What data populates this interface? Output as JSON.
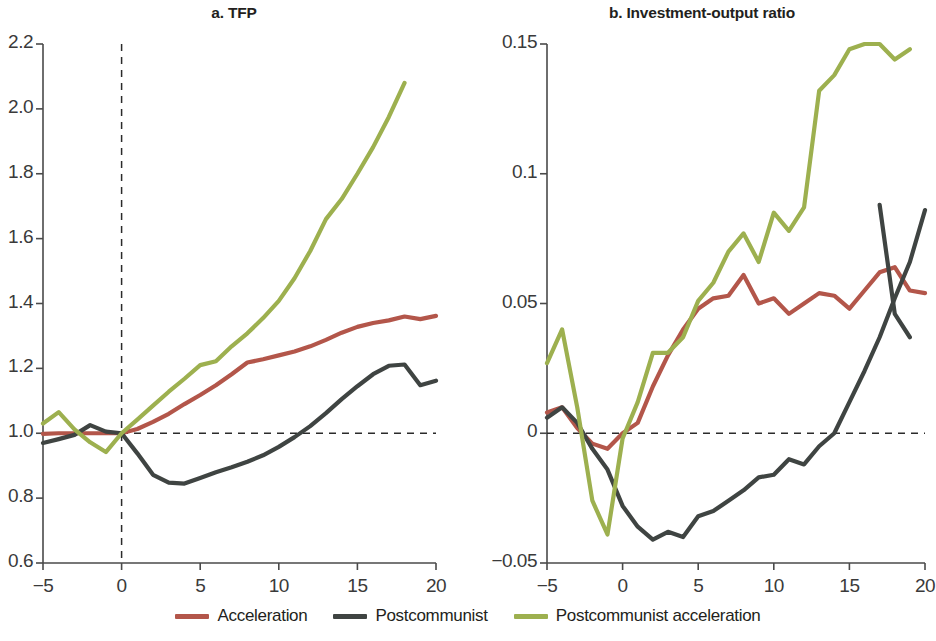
{
  "figure": {
    "width": 936,
    "height": 641,
    "background": "#ffffff"
  },
  "colors": {
    "acceleration": "#b3564a",
    "postcommunist": "#3f4442",
    "postcommunist_acceleration": "#9db04f",
    "axis": "#4a4a4a",
    "text": "#231f20"
  },
  "legend": {
    "position": "bottom-center",
    "items": [
      {
        "label": "Acceleration",
        "color": "#b3564a"
      },
      {
        "label": "Postcommunist",
        "color": "#3f4442"
      },
      {
        "label": "Postcommunist acceleration",
        "color": "#9db04f"
      }
    ]
  },
  "panel_a": {
    "title": "a. TFP",
    "ytick_labels": [
      "2.2",
      "2.0",
      "1.8",
      "1.6",
      "1.4",
      "1.2",
      "1.0",
      "0.8",
      "0.6"
    ],
    "xtick_labels": [
      "−5",
      "0",
      "5",
      "10",
      "15",
      "20"
    ]
  },
  "panel_b": {
    "title": "b. Investment-output ratio",
    "ytick_labels": [
      "0.15",
      "0.1",
      "0.05",
      "0",
      "−0.05"
    ],
    "xtick_labels": [
      "−5",
      "0",
      "5",
      "10",
      "15",
      "20"
    ]
  },
  "chart_data": [
    {
      "type": "line",
      "panel": "a",
      "title": "a. TFP",
      "xlabel": "",
      "ylabel": "",
      "xlim": [
        -5,
        20
      ],
      "ylim": [
        0.6,
        2.2
      ],
      "xticks": [
        -5,
        0,
        5,
        10,
        15,
        20
      ],
      "yticks": [
        0.6,
        0.8,
        1.0,
        1.2,
        1.4,
        1.6,
        1.8,
        2.0,
        2.2
      ],
      "grid": false,
      "reference_lines": [
        {
          "orientation": "vertical",
          "value": 0,
          "style": "dashed"
        },
        {
          "orientation": "horizontal",
          "value": 1.0,
          "style": "dashed"
        }
      ],
      "x": [
        -5,
        -4,
        -3,
        -2,
        -1,
        0,
        1,
        2,
        3,
        4,
        5,
        6,
        7,
        8,
        9,
        10,
        11,
        12,
        13,
        14,
        15,
        16,
        17,
        18,
        19,
        20
      ],
      "series": [
        {
          "name": "Acceleration",
          "color": "#b3564a",
          "values": [
            0.998,
            1.0,
            1.0,
            1.0,
            1.0,
            1.0,
            1.013,
            1.035,
            1.06,
            1.09,
            1.118,
            1.148,
            1.182,
            1.218,
            1.228,
            1.24,
            1.252,
            1.268,
            1.288,
            1.31,
            1.328,
            1.34,
            1.348,
            1.36,
            1.352,
            1.362
          ]
        },
        {
          "name": "Postcommunist",
          "color": "#3f4442",
          "values": [
            0.97,
            0.982,
            0.995,
            1.025,
            1.005,
            1.0,
            0.938,
            0.872,
            0.848,
            0.845,
            0.862,
            0.88,
            0.895,
            0.912,
            0.932,
            0.958,
            0.988,
            1.022,
            1.062,
            1.105,
            1.145,
            1.182,
            1.208,
            1.212,
            1.148,
            1.162
          ]
        },
        {
          "name": "Postcommunist acceleration",
          "color": "#9db04f",
          "values": [
            1.03,
            1.065,
            1.012,
            0.972,
            0.942,
            1.0,
            1.042,
            1.085,
            1.128,
            1.168,
            1.21,
            1.222,
            1.268,
            1.308,
            1.355,
            1.408,
            1.478,
            1.562,
            1.66,
            1.722,
            1.8,
            1.882,
            1.975,
            2.08,
            null,
            null
          ]
        }
      ]
    },
    {
      "type": "line",
      "panel": "b",
      "title": "b. Investment-output ratio",
      "xlabel": "",
      "ylabel": "",
      "xlim": [
        -5,
        20
      ],
      "ylim": [
        -0.05,
        0.15
      ],
      "xticks": [
        -5,
        0,
        5,
        10,
        15,
        20
      ],
      "yticks": [
        -0.05,
        0,
        0.05,
        0.1,
        0.15
      ],
      "grid": false,
      "reference_lines": [
        {
          "orientation": "horizontal",
          "value": 0,
          "style": "dashed"
        }
      ],
      "x": [
        -5,
        -4,
        -3,
        -2,
        -1,
        0,
        1,
        2,
        3,
        4,
        5,
        6,
        7,
        8,
        9,
        10,
        11,
        12,
        13,
        14,
        15,
        16,
        17,
        18,
        19,
        20
      ],
      "series": [
        {
          "name": "Acceleration",
          "color": "#b3564a",
          "values": [
            0.008,
            0.01,
            0.002,
            -0.004,
            -0.006,
            0.0,
            0.004,
            0.018,
            0.03,
            0.04,
            0.048,
            0.052,
            0.053,
            0.061,
            0.05,
            0.052,
            0.046,
            0.05,
            0.054,
            0.053,
            0.048,
            0.055,
            0.062,
            0.064,
            0.055,
            0.054
          ]
        },
        {
          "name": "Postcommunist",
          "color": "#3f4442",
          "values": [
            0.006,
            0.01,
            0.004,
            -0.006,
            -0.014,
            -0.028,
            -0.036,
            -0.041,
            -0.038,
            -0.04,
            -0.032,
            -0.03,
            -0.026,
            -0.022,
            -0.017,
            -0.016,
            -0.01,
            -0.012,
            -0.005,
            0.0,
            0.012,
            0.024,
            0.037,
            0.052,
            0.066,
            0.086
          ]
        },
        {
          "name": "Postcommunist acceleration",
          "color": "#9db04f",
          "values": [
            0.027,
            0.04,
            0.01,
            -0.026,
            -0.039,
            -0.002,
            0.012,
            0.031,
            0.031,
            0.037,
            0.051,
            0.058,
            0.07,
            0.077,
            0.066,
            0.085,
            0.078,
            0.087,
            0.132,
            0.138,
            0.148,
            0.15,
            0.15,
            0.144,
            0.148,
            null
          ]
        }
      ]
    },
    {
      "type": "line",
      "panel": "b-extra",
      "note": "Postcommunist series in panel b continues past x=17 with a sharp decline",
      "x": [
        17,
        18,
        19
      ],
      "series": [
        {
          "name": "Postcommunist",
          "color": "#3f4442",
          "values": [
            0.088,
            0.046,
            0.037
          ]
        }
      ]
    }
  ]
}
